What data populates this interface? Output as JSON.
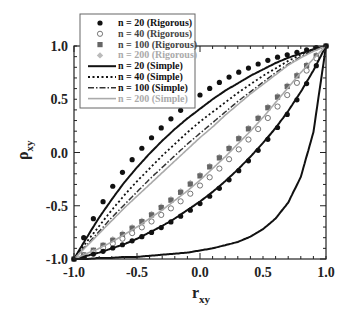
{
  "chart_data": {
    "type": "line",
    "title": "",
    "xlabel": "r",
    "xlabel_sub": "xy",
    "ylabel": "ρ",
    "ylabel_sub": "xy",
    "xlim": [
      -1.0,
      1.0
    ],
    "ylim": [
      -1.0,
      1.0
    ],
    "x_ticks": [
      -1.0,
      -0.5,
      0.0,
      0.5,
      1.0
    ],
    "x_tick_labels": [
      "-1.0",
      "-0.5",
      "0.0",
      "0.5",
      "1.0"
    ],
    "y_ticks": [
      -1.0,
      -0.5,
      0.0,
      0.5,
      1.0
    ],
    "y_tick_labels": [
      "-1.0",
      "-0.5",
      "0.0",
      "0.5",
      "1.0"
    ],
    "grid": false,
    "legend_position": "upper left",
    "legend": [
      {
        "label": "n = 20 (Rigorous)",
        "marker": "filled-circle",
        "color": "#111111"
      },
      {
        "label": "n = 40 (Rigorous)",
        "marker": "open-circle",
        "color": "#777777"
      },
      {
        "label": "n = 100 (Rigorous)",
        "marker": "filled-square",
        "color": "#666666"
      },
      {
        "label": "n = 200 (Rigorous)",
        "marker": "filled-diamond",
        "color": "#bbbbbb"
      },
      {
        "label": "n = 20 (Simple)",
        "line": "solid",
        "color": "#111111"
      },
      {
        "label": "n = 40 (Simple)",
        "line": "dotted",
        "color": "#111111"
      },
      {
        "label": "n = 100 (Simple)",
        "line": "dash-dot",
        "color": "#333333"
      },
      {
        "label": "n = 200 (Simple)",
        "line": "solid-thin",
        "color": "#aaaaaa"
      }
    ],
    "x": [
      -1.0,
      -0.9,
      -0.8,
      -0.7,
      -0.6,
      -0.5,
      -0.4,
      -0.3,
      -0.2,
      -0.1,
      0.0,
      0.1,
      0.2,
      0.3,
      0.4,
      0.5,
      0.6,
      0.7,
      0.8,
      0.9,
      1.0
    ],
    "families": [
      {
        "name": "upper family",
        "series": [
          {
            "name": "n = 20 (Rigorous)",
            "values": [
              -1.0,
              -0.74,
              -0.52,
              -0.33,
              -0.16,
              -0.01,
              0.12,
              0.24,
              0.35,
              0.45,
              0.54,
              0.62,
              0.69,
              0.75,
              0.8,
              0.85,
              0.89,
              0.92,
              0.95,
              0.98,
              1.0
            ]
          },
          {
            "name": "n = 20 (Simple)",
            "values": [
              -1.0,
              -0.8,
              -0.61,
              -0.44,
              -0.28,
              -0.14,
              -0.01,
              0.11,
              0.22,
              0.32,
              0.41,
              0.5,
              0.58,
              0.65,
              0.72,
              0.78,
              0.84,
              0.89,
              0.93,
              0.97,
              1.0
            ]
          },
          {
            "name": "n = 40 (Simple)",
            "values": [
              -1.0,
              -0.84,
              -0.69,
              -0.54,
              -0.4,
              -0.27,
              -0.15,
              -0.03,
              0.08,
              0.19,
              0.29,
              0.38,
              0.47,
              0.56,
              0.64,
              0.72,
              0.79,
              0.86,
              0.92,
              0.96,
              1.0
            ]
          },
          {
            "name": "n = 100 (Simple)",
            "values": [
              -1.0,
              -0.87,
              -0.74,
              -0.61,
              -0.49,
              -0.37,
              -0.25,
              -0.14,
              -0.03,
              0.08,
              0.18,
              0.28,
              0.38,
              0.48,
              0.57,
              0.66,
              0.75,
              0.83,
              0.9,
              0.96,
              1.0
            ]
          },
          {
            "name": "n = 200 (Simple)",
            "values": [
              -1.0,
              -0.88,
              -0.76,
              -0.64,
              -0.52,
              -0.41,
              -0.3,
              -0.19,
              -0.08,
              0.03,
              0.14,
              0.24,
              0.35,
              0.45,
              0.55,
              0.64,
              0.73,
              0.82,
              0.89,
              0.95,
              1.0
            ]
          }
        ]
      },
      {
        "name": "lower family",
        "series": [
          {
            "name": "n = 200 (Rigorous)",
            "values": [
              -1.0,
              -0.95,
              -0.89,
              -0.82,
              -0.75,
              -0.67,
              -0.59,
              -0.5,
              -0.41,
              -0.31,
              -0.21,
              -0.1,
              0.01,
              0.13,
              0.25,
              0.38,
              0.51,
              0.64,
              0.77,
              0.89,
              1.0
            ]
          },
          {
            "name": "n = 100 (Rigorous)",
            "values": [
              -1.0,
              -0.95,
              -0.89,
              -0.83,
              -0.76,
              -0.68,
              -0.6,
              -0.51,
              -0.42,
              -0.32,
              -0.22,
              -0.11,
              0.0,
              0.12,
              0.24,
              0.37,
              0.5,
              0.63,
              0.76,
              0.88,
              1.0
            ]
          },
          {
            "name": "n = 40 (Rigorous)",
            "values": [
              -1.0,
              -0.96,
              -0.91,
              -0.86,
              -0.8,
              -0.73,
              -0.66,
              -0.58,
              -0.5,
              -0.41,
              -0.31,
              -0.21,
              -0.1,
              0.02,
              0.14,
              0.27,
              0.41,
              0.55,
              0.7,
              0.85,
              1.0
            ]
          },
          {
            "name": "n = 20 (Rigorous)",
            "values": [
              -1.0,
              -0.97,
              -0.94,
              -0.9,
              -0.86,
              -0.81,
              -0.76,
              -0.7,
              -0.63,
              -0.56,
              -0.48,
              -0.39,
              -0.29,
              -0.18,
              -0.06,
              0.07,
              0.21,
              0.37,
              0.55,
              0.76,
              1.0
            ]
          },
          {
            "name": "n = 20 (Simple)",
            "values": [
              -1.0,
              -0.97,
              -0.94,
              -0.9,
              -0.86,
              -0.81,
              -0.75,
              -0.69,
              -0.62,
              -0.54,
              -0.46,
              -0.37,
              -0.27,
              -0.16,
              -0.04,
              0.09,
              0.23,
              0.39,
              0.57,
              0.77,
              1.0
            ]
          },
          {
            "name": "n = 200 (Simple)",
            "values": [
              -1.0,
              -0.95,
              -0.9,
              -0.84,
              -0.77,
              -0.7,
              -0.62,
              -0.54,
              -0.45,
              -0.36,
              -0.26,
              -0.15,
              -0.04,
              0.08,
              0.2,
              0.33,
              0.47,
              0.61,
              0.75,
              0.88,
              1.0
            ]
          }
        ]
      },
      {
        "name": "bottom curve",
        "series": [
          {
            "name": "n = 20 (Simple)",
            "values": [
              -1.0,
              -1.0,
              -0.99,
              -0.99,
              -0.98,
              -0.98,
              -0.97,
              -0.96,
              -0.95,
              -0.94,
              -0.92,
              -0.9,
              -0.87,
              -0.84,
              -0.79,
              -0.72,
              -0.62,
              -0.47,
              -0.23,
              0.19,
              1.0
            ]
          }
        ]
      }
    ]
  },
  "style": {
    "frame_color": "#222222",
    "legend_border": "#666666"
  }
}
